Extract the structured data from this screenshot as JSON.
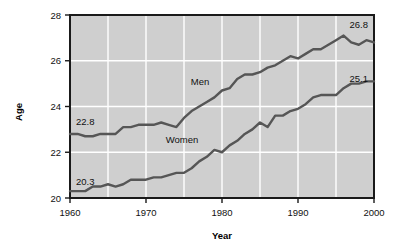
{
  "chart_data": {
    "type": "line",
    "title": "",
    "xlabel": "Year",
    "ylabel": "Age",
    "xlim": [
      1960,
      2000
    ],
    "ylim": [
      20,
      28
    ],
    "grid": true,
    "legend_position": "inline-annotations",
    "x_ticks": [
      "1960",
      "1970",
      "1980",
      "1990",
      "2000"
    ],
    "x_tick_values": [
      1960,
      1970,
      1980,
      1990,
      2000
    ],
    "x_minor_gridlines": [
      1965,
      1970,
      1975,
      1980,
      1985,
      1990,
      1995
    ],
    "y_ticks": [
      "20",
      "22",
      "24",
      "26",
      "28"
    ],
    "y_tick_values": [
      20,
      22,
      24,
      26,
      28
    ],
    "y_gridlines": [
      22,
      24,
      26
    ],
    "x": [
      1960,
      1961,
      1962,
      1963,
      1964,
      1965,
      1966,
      1967,
      1968,
      1969,
      1970,
      1971,
      1972,
      1973,
      1974,
      1975,
      1976,
      1977,
      1978,
      1979,
      1980,
      1981,
      1982,
      1983,
      1984,
      1985,
      1986,
      1987,
      1988,
      1989,
      1990,
      1991,
      1992,
      1993,
      1994,
      1995,
      1996,
      1997,
      1998,
      1999,
      2000
    ],
    "series": [
      {
        "name": "Men",
        "color": "#565656",
        "label_start": "22.8",
        "label_end": "26.8",
        "values": [
          22.8,
          22.8,
          22.7,
          22.7,
          22.8,
          22.8,
          22.8,
          23.1,
          23.1,
          23.2,
          23.2,
          23.2,
          23.3,
          23.2,
          23.1,
          23.5,
          23.8,
          24.0,
          24.2,
          24.4,
          24.7,
          24.8,
          25.2,
          25.4,
          25.4,
          25.5,
          25.7,
          25.8,
          26.0,
          26.2,
          26.1,
          26.3,
          26.5,
          26.5,
          26.7,
          26.9,
          27.1,
          26.8,
          26.7,
          26.9,
          26.8
        ]
      },
      {
        "name": "Women",
        "color": "#565656",
        "label_start": "20.3",
        "label_end": "25.1",
        "values": [
          20.3,
          20.3,
          20.3,
          20.5,
          20.5,
          20.6,
          20.5,
          20.6,
          20.8,
          20.8,
          20.8,
          20.9,
          20.9,
          21.0,
          21.1,
          21.1,
          21.3,
          21.6,
          21.8,
          22.1,
          22.0,
          22.3,
          22.5,
          22.8,
          23.0,
          23.3,
          23.1,
          23.6,
          23.6,
          23.8,
          23.9,
          24.1,
          24.4,
          24.5,
          24.5,
          24.5,
          24.8,
          25.0,
          25.0,
          25.1,
          25.1
        ]
      }
    ]
  },
  "labels": {
    "y_axis_title": "Age",
    "x_axis_title": "Year"
  }
}
